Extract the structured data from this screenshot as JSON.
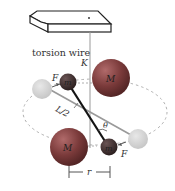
{
  "diagram": {
    "labels": {
      "torsion_wire": "torsion wire",
      "K": "K",
      "F_top": "F",
      "F_bottom": "F",
      "m_top": "m",
      "m_bottom": "m",
      "M_top": "M",
      "M_bottom": "M",
      "L_half": "L/2",
      "theta": "θ",
      "r": "r"
    },
    "colors": {
      "large_mass": "#7a3a3a",
      "small_mass": "#3c2c2c",
      "ghost_mass": "#cfcfcf",
      "rod": "#1a1a1a",
      "orbit": "#aaaaaa"
    }
  }
}
